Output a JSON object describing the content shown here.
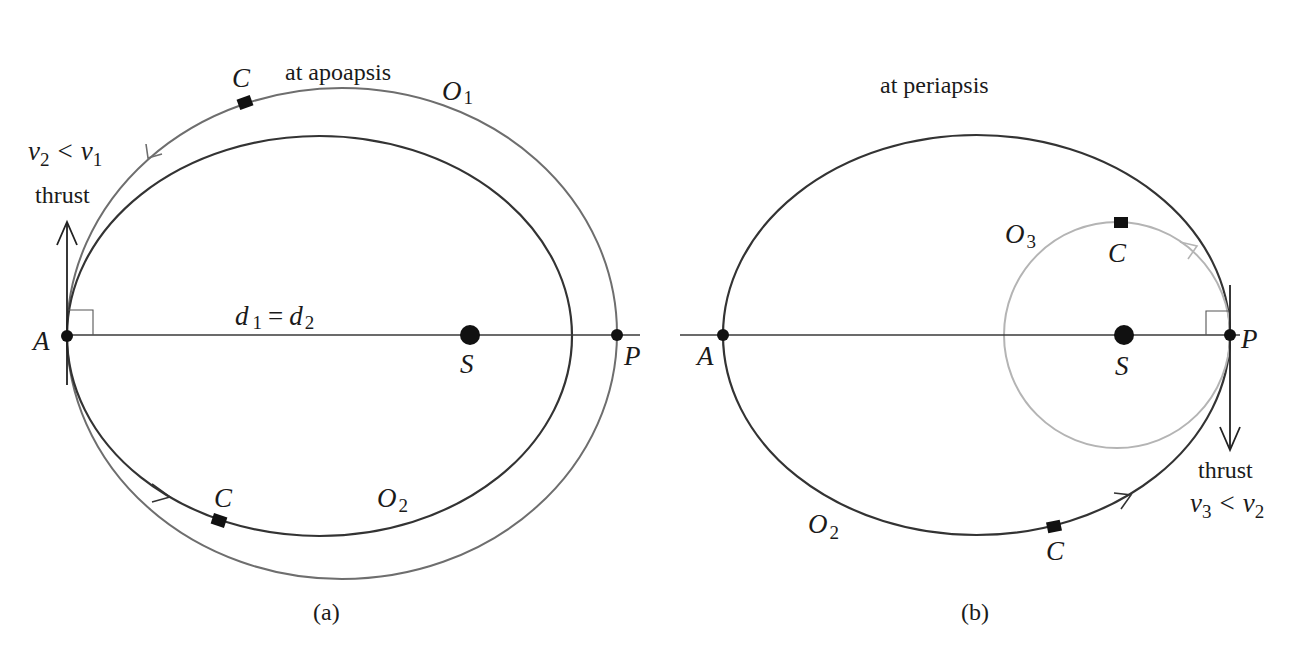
{
  "figure": {
    "colors": {
      "dark_orbit": "#333333",
      "mid_orbit": "#6e6e6e",
      "light_orbit": "#b4b4b4",
      "axis": "#3a3a3a",
      "ink": "#111111"
    },
    "panel_a": {
      "caption": "(a)",
      "event_label": "at apoapsis",
      "thrust_label": "thrust",
      "velocity_relation": {
        "v_left": "v",
        "v_left_sub": "2",
        "op": "<",
        "v_right": "v",
        "v_right_sub": "1"
      },
      "distance_relation": {
        "d_left": "d",
        "d_left_sub": "1",
        "op": "=",
        "d_right": "d",
        "d_right_sub": "2"
      },
      "points": {
        "apoapsis": "A",
        "focus": "S",
        "periapsis": "P"
      },
      "orbits": [
        {
          "name": "O",
          "sub": "1",
          "role": "initial orbit (outer, grey)"
        },
        {
          "name": "O",
          "sub": "2",
          "role": "new orbit after retro-burn at apoapsis (dark)"
        }
      ],
      "craft_label": "C"
    },
    "panel_b": {
      "caption": "(b)",
      "event_label": "at periapsis",
      "thrust_label": "thrust",
      "velocity_relation": {
        "v_left": "v",
        "v_left_sub": "3",
        "op": "<",
        "v_right": "v",
        "v_right_sub": "2"
      },
      "points": {
        "apoapsis": "A",
        "focus": "S",
        "periapsis": "P"
      },
      "orbits": [
        {
          "name": "O",
          "sub": "2",
          "role": "elliptical orbit (dark)"
        },
        {
          "name": "O",
          "sub": "3",
          "role": "circular orbit after burn at periapsis (light grey)"
        }
      ],
      "craft_label": "C"
    }
  }
}
